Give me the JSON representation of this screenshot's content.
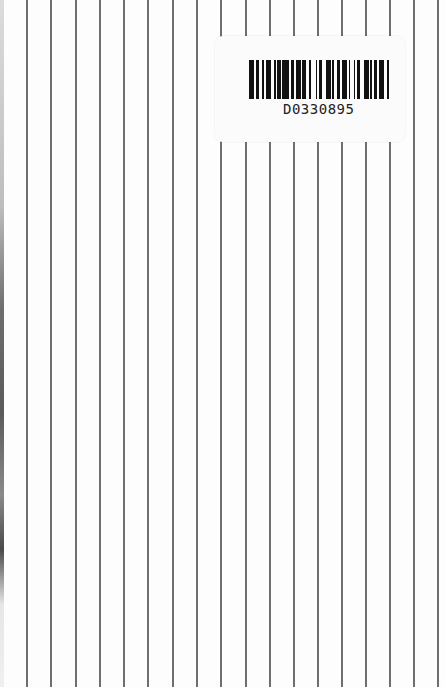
{
  "page": {
    "background_color": "#fdfdfd",
    "rule_color": "#6f6f6f",
    "rule_positions_px": [
      27,
      51,
      76,
      100,
      124,
      148,
      173,
      197,
      221,
      246,
      270,
      294,
      318,
      342,
      366,
      390,
      414,
      438
    ]
  },
  "barcode_label": {
    "text": "D0330895",
    "bar_color": "#111111",
    "label_color": "#fbfbfb"
  }
}
